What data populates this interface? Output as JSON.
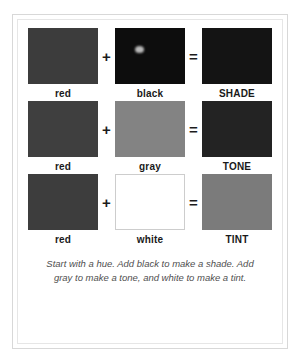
{
  "figure": {
    "caption": "Start with a hue. Add black to make a shade. Add gray to make a tone, and white to make a tint.",
    "operators": {
      "plus": "+",
      "equals": "="
    },
    "rows": [
      {
        "name": "shade-row",
        "base": {
          "label": "red",
          "color": "#3c3c3c"
        },
        "operator": "+",
        "modifier": {
          "label": "black",
          "color": "#0d0d0d"
        },
        "equals": "=",
        "result": {
          "label": "SHADE",
          "color": "#141414"
        }
      },
      {
        "name": "tone-row",
        "base": {
          "label": "red",
          "color": "#3f3f3f"
        },
        "operator": "+",
        "modifier": {
          "label": "gray",
          "color": "#838383"
        },
        "equals": "=",
        "result": {
          "label": "TONE",
          "color": "#232323"
        }
      },
      {
        "name": "tint-row",
        "base": {
          "label": "red",
          "color": "#3d3d3d"
        },
        "operator": "+",
        "modifier": {
          "label": "white",
          "color": "#ffffff"
        },
        "equals": "=",
        "result": {
          "label": "TINT",
          "color": "#7b7b7b"
        }
      }
    ]
  }
}
